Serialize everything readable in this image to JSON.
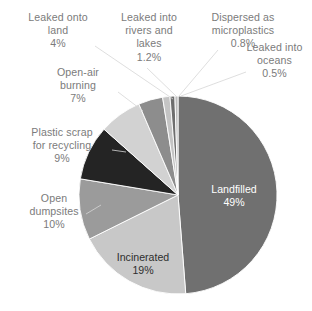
{
  "chart_data": {
    "type": "pie",
    "title": "",
    "subtitle": "",
    "xlabel": "",
    "ylabel": "",
    "legend_position": "none",
    "grid": false,
    "units": "percent",
    "start_angle_deg": 0,
    "direction": "clockwise",
    "categories": [
      "Landfilled",
      "Incinerated",
      "Open dumpsites",
      "Plastic scrap for recycling",
      "Open-air burning",
      "Leaked onto land",
      "Leaked into rivers and lakes",
      "Dispersed as microplastics",
      "Leaked into oceans"
    ],
    "values": [
      49,
      19,
      10,
      9,
      7,
      4,
      1.2,
      0.8,
      0.5
    ],
    "value_labels": [
      "49%",
      "19%",
      "10%",
      "9%",
      "7%",
      "4%",
      "1.2%",
      "0.8%",
      "0.5%"
    ],
    "colors": [
      "#707070",
      "#c8c8c8",
      "#9b9b9b",
      "#242424",
      "#d2d2d2",
      "#8d8d8d",
      "#c4c4c4",
      "#6e6e6e",
      "#bdbdbd"
    ],
    "slices": [
      {
        "name": "Landfilled",
        "label": "Landfilled",
        "value": 49,
        "value_label": "49%",
        "color": "#707070",
        "label_placement": "inside",
        "label_color": "#ffffff"
      },
      {
        "name": "Incinerated",
        "label": "Incinerated",
        "value": 19,
        "value_label": "19%",
        "color": "#c8c8c8",
        "label_placement": "inside",
        "label_color": "#2e2e2e"
      },
      {
        "name": "Open dumpsites",
        "label_line1": "Open",
        "label_line2": "dumpsites",
        "value": 10,
        "value_label": "10%",
        "color": "#9b9b9b",
        "label_placement": "outside",
        "label_color": "#7b7b7b"
      },
      {
        "name": "Plastic scrap for recycling",
        "label_line1": "Plastic scrap",
        "label_line2": "for recycling",
        "value": 9,
        "value_label": "9%",
        "color": "#242424",
        "label_placement": "outside",
        "label_color": "#7b7b7b"
      },
      {
        "name": "Open-air burning",
        "label_line1": "Open-air",
        "label_line2": "burning",
        "value": 7,
        "value_label": "7%",
        "color": "#d2d2d2",
        "label_placement": "outside",
        "label_color": "#7b7b7b"
      },
      {
        "name": "Leaked onto land",
        "label_line1": "Leaked onto",
        "label_line2": "land",
        "value": 4,
        "value_label": "4%",
        "color": "#8d8d8d",
        "label_placement": "outside",
        "label_color": "#7b7b7b"
      },
      {
        "name": "Leaked into rivers and lakes",
        "label_line1": "Leaked into",
        "label_line2": "rivers and",
        "label_line3": "lakes",
        "value": 1.2,
        "value_label": "1.2%",
        "color": "#c4c4c4",
        "label_placement": "outside",
        "label_color": "#7b7b7b"
      },
      {
        "name": "Dispersed as microplastics",
        "label_line1": "Dispersed as",
        "label_line2": "microplastics",
        "value": 0.8,
        "value_label": "0.8%",
        "color": "#6e6e6e",
        "label_placement": "outside",
        "label_color": "#7b7b7b"
      },
      {
        "name": "Leaked into oceans",
        "label_line1": "Leaked into",
        "label_line2": "oceans",
        "value": 0.5,
        "value_label": "0.5%",
        "color": "#bdbdbd",
        "label_placement": "outside",
        "label_color": "#7b7b7b"
      }
    ]
  },
  "labels": {
    "leaked_land": {
      "line1": "Leaked onto",
      "line2": "land",
      "pct": "4%"
    },
    "rivers_lakes": {
      "line1": "Leaked into",
      "line2": "rivers and",
      "line3": "lakes",
      "pct": "1.2%"
    },
    "microplastics": {
      "line1": "Dispersed as",
      "line2": "microplastics",
      "pct": "0.8%"
    },
    "oceans": {
      "line1": "Leaked into",
      "line2": "oceans",
      "pct": "0.5%"
    },
    "openair": {
      "line1": "Open-air",
      "line2": "burning",
      "pct": "7%"
    },
    "recycling": {
      "line1": "Plastic scrap",
      "line2": "for recycling",
      "pct": "9%"
    },
    "dumpsites": {
      "line1": "Open",
      "line2": "dumpsites",
      "pct": "10%"
    },
    "incinerated": {
      "line1": "Incinerated",
      "pct": "19%"
    },
    "landfilled": {
      "line1": "Landfilled",
      "pct": "49%"
    }
  },
  "theme": {
    "background": "#ffffff",
    "label_text": "#7b7b7b",
    "inside_light_text": "#ffffff",
    "inside_dark_text": "#2e2e2e",
    "leader_line": "#d6d6d6"
  }
}
